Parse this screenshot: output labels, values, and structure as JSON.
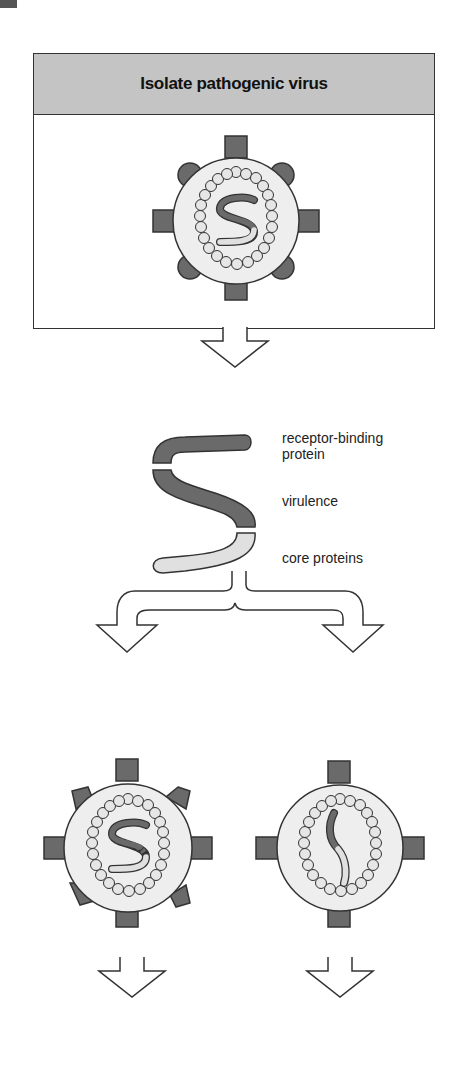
{
  "corner_marker": {
    "color": "#555555"
  },
  "steps": [
    {
      "id": "isolate-virus",
      "title": "Isolate pathogenic virus"
    },
    {
      "id": "isolate-gene",
      "title": "Isolate virulence gene",
      "gene_labels": [
        {
          "segment": "top",
          "label_line1": "receptor-binding",
          "label_line2": "protein"
        },
        {
          "segment": "middle",
          "label_line1": "virulence"
        },
        {
          "segment": "bottom",
          "label_line1": "core proteins"
        }
      ]
    },
    {
      "id": "mutate-gene",
      "title_line1": "Mutate virulence",
      "title_line2": "gene"
    },
    {
      "id": "delete-gene",
      "title_line1": "Delete virulence",
      "title_line2": "gene"
    }
  ],
  "result": {
    "line1": "Resulting virus is viable, immunogenic but",
    "line2": "avirulent. It can be used as a vaccine"
  },
  "colors": {
    "header_fill": "#c4c4c4",
    "dark_gray": "#6a6a6a",
    "light_gray": "#e0e0e0",
    "outline": "#333333"
  }
}
